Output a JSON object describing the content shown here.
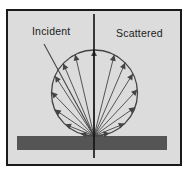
{
  "diagram": {
    "labels": {
      "incident": "Incident",
      "scattered": "Scattered"
    },
    "colors": {
      "background": "#ffffff",
      "panel": "#dcdcdc",
      "frame": "#1a1a1a",
      "surface": "#555555",
      "lines": "#444444",
      "normal": "#111111"
    },
    "frame": {
      "x": 7,
      "y": 10,
      "width": 174,
      "height": 155
    },
    "surface": {
      "x": 17,
      "y": 136,
      "width": 150,
      "height": 14
    },
    "normal_line": {
      "x": 94,
      "y1": 14,
      "y2": 158
    },
    "circle": {
      "cx": 94.5,
      "cy": 93,
      "r": 43
    },
    "origin": {
      "x": 94,
      "y": 136
    },
    "incident_ray": {
      "x1": 44,
      "y1": 44,
      "x2": 94,
      "y2": 136
    },
    "scattered_ray_angles_deg": [
      10,
      22,
      35,
      47,
      58,
      67,
      76,
      90,
      103,
      113,
      123,
      134,
      146,
      158,
      170
    ]
  }
}
